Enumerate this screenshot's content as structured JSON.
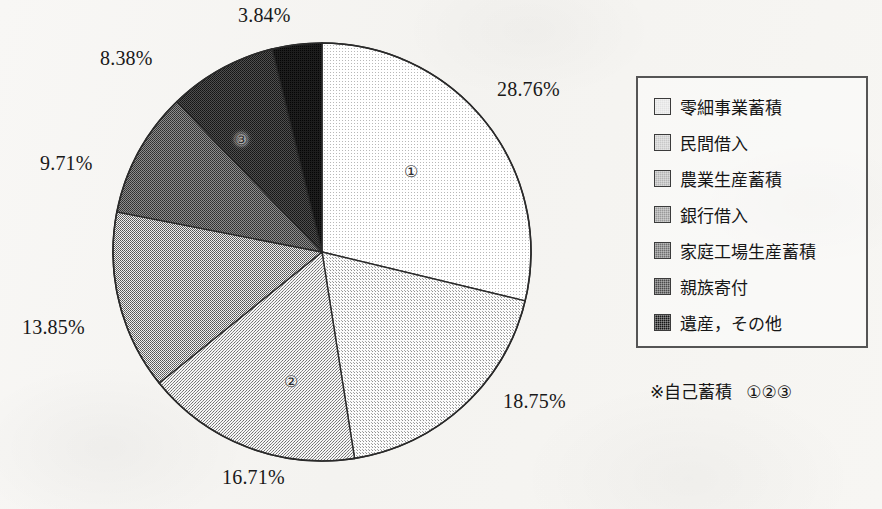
{
  "chart_data": {
    "type": "pie",
    "title": "",
    "subtitle": "",
    "xlabel": "",
    "ylabel": "",
    "legend_position": "right",
    "grid": false,
    "unit": "%",
    "start_angle_deg": 0,
    "direction": "clockwise",
    "categories": [
      "零細事業蓄積",
      "民間借入",
      "農業生産蓄積",
      "銀行借入",
      "家庭工場生産蓄積",
      "親族寄付",
      "遺産，その他"
    ],
    "values": [
      28.76,
      18.75,
      16.71,
      13.85,
      9.71,
      8.38,
      3.84
    ],
    "value_labels": [
      "28.76%",
      "18.75%",
      "16.71%",
      "13.85%",
      "9.71%",
      "8.38%",
      "3.84%"
    ],
    "slice_colors": [
      "#e2e2e2",
      "#c8c8c8",
      "#b3b3b3",
      "#9a9a9a",
      "#6f6f6f",
      "#4a4a4a",
      "#161616"
    ],
    "slice_markers": [
      "①",
      "",
      "②",
      "",
      "",
      "③",
      ""
    ],
    "annotations": [
      "※自己蓄積 ①②③"
    ]
  },
  "pie": {
    "center_x": 322,
    "center_y": 252,
    "radius": 209,
    "outline_color": "#2a2a2a",
    "labels": [
      {
        "text": "28.76%",
        "left": 497,
        "top": 78
      },
      {
        "text": "18.75%",
        "left": 503,
        "top": 390
      },
      {
        "text": "16.71%",
        "left": 222,
        "top": 466
      },
      {
        "text": "13.85%",
        "left": 22,
        "top": 316
      },
      {
        "text": "9.71%",
        "top": 152,
        "left": 40
      },
      {
        "text": "8.38%",
        "left": 100,
        "top": 47
      },
      {
        "text": "3.84%",
        "left": 238,
        "top": 4
      }
    ],
    "markers": [
      {
        "text": "①",
        "left": 404,
        "top": 164
      },
      {
        "text": "②",
        "left": 284,
        "top": 374
      },
      {
        "text": "③",
        "left": 234,
        "top": 132
      }
    ]
  },
  "legend": {
    "items": [
      {
        "label": "零細事業蓄積",
        "color": "#e2e2e2"
      },
      {
        "label": "民間借入",
        "color": "#c8c8c8"
      },
      {
        "label": "農業生産蓄積",
        "color": "#b3b3b3"
      },
      {
        "label": "銀行借入",
        "color": "#9a9a9a"
      },
      {
        "label": "家庭工場生産蓄積",
        "color": "#6f6f6f"
      },
      {
        "label": "親族寄付",
        "color": "#4a4a4a"
      },
      {
        "label": "遺産，その他",
        "color": "#161616"
      }
    ],
    "note_text": "※自己蓄積",
    "note_circles": "①②③"
  }
}
